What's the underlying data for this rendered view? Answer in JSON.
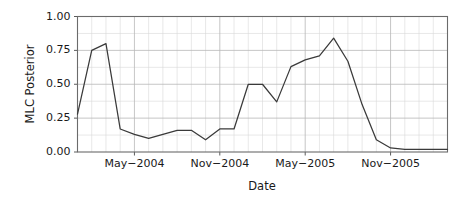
{
  "chart_data": {
    "type": "line",
    "title": "",
    "xlabel": "Date",
    "ylabel": "MLC Posterior",
    "grid": true,
    "legend": "none",
    "ylim": [
      0.0,
      1.0
    ],
    "y_ticks": [
      "0.00",
      "0.25",
      "0.50",
      "0.75",
      "1.00"
    ],
    "y_tick_values": [
      0.0,
      0.25,
      0.5,
      0.75,
      1.0
    ],
    "x_ticks": [
      "May−2004",
      "Nov−2004",
      "May−2005",
      "Nov−2005"
    ],
    "x_tick_values": [
      4,
      10,
      16,
      22
    ],
    "xlim": [
      0,
      26
    ],
    "x": [
      0,
      1,
      2,
      3,
      4,
      5,
      6,
      7,
      8,
      9,
      10,
      11,
      12,
      13,
      14,
      15,
      16,
      17,
      18,
      19,
      20,
      21,
      22,
      23,
      24,
      25,
      26
    ],
    "values": [
      0.28,
      0.75,
      0.8,
      0.17,
      0.13,
      0.1,
      0.13,
      0.16,
      0.16,
      0.09,
      0.17,
      0.17,
      0.5,
      0.5,
      0.37,
      0.63,
      0.68,
      0.71,
      0.84,
      0.67,
      0.35,
      0.09,
      0.03,
      0.02,
      0.02,
      0.02,
      0.02
    ],
    "series": [
      {
        "name": "MLC Posterior",
        "color": "#3a3a3a",
        "values": [
          0.28,
          0.75,
          0.8,
          0.17,
          0.13,
          0.1,
          0.13,
          0.16,
          0.16,
          0.09,
          0.17,
          0.17,
          0.5,
          0.5,
          0.37,
          0.63,
          0.68,
          0.71,
          0.84,
          0.67,
          0.35,
          0.09,
          0.03,
          0.02,
          0.02,
          0.02,
          0.02
        ]
      }
    ],
    "colors": {
      "line": "#3a3a3a",
      "grid_minor": "#d9d9d9",
      "grid_major": "#b8b8b8",
      "panel_border": "#6b6b6b",
      "background": "#ffffff",
      "text": "#1a1a1a"
    }
  }
}
